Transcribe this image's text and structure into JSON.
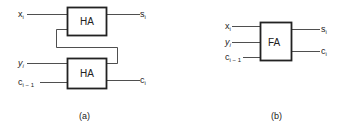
{
  "figure_a": {
    "caption": "(a)",
    "top_block": "HA",
    "bottom_block": "HA",
    "inputs": {
      "x": "x",
      "y": "y",
      "c": "c"
    },
    "input_subscripts": {
      "x": "i",
      "y": "i",
      "c": "i − 1"
    },
    "outputs": {
      "s": "s",
      "c": "c"
    },
    "output_subscripts": {
      "s": "i",
      "c": "i"
    }
  },
  "figure_b": {
    "caption": "(b)",
    "block": "FA",
    "inputs": {
      "x": "x",
      "y": "y",
      "c": "c"
    },
    "input_subscripts": {
      "x": "i",
      "y": "i",
      "c": "i − 1"
    },
    "outputs": {
      "s": "s",
      "c": "c"
    },
    "output_subscripts": {
      "s": "i",
      "c": "i"
    }
  },
  "colors": {
    "line": "#222222",
    "text": "#222222",
    "background": "#ffffff"
  }
}
